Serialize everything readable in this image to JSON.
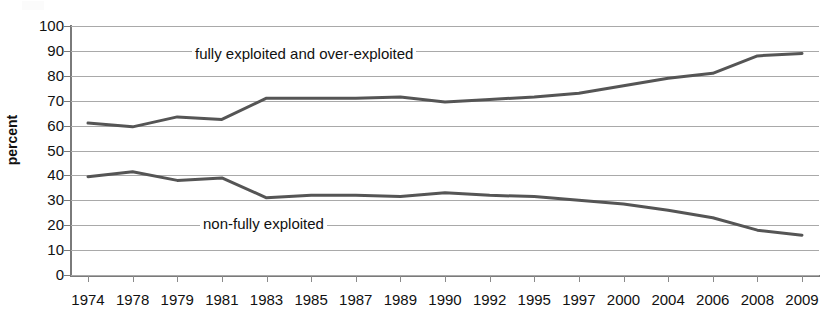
{
  "chart_data": {
    "type": "line",
    "title": "",
    "subtitle": "",
    "xlabel": "",
    "ylabel": "percent",
    "ylim": [
      0,
      100
    ],
    "ytick_step": 10,
    "yticks": [
      100,
      90,
      80,
      70,
      60,
      50,
      40,
      30,
      20,
      10,
      0
    ],
    "grid": true,
    "legend_position": "inline-annotations",
    "categories": [
      "1974",
      "1978",
      "1979",
      "1981",
      "1983",
      "1985",
      "1987",
      "1989",
      "1990",
      "1992",
      "1995",
      "1997",
      "2000",
      "2004",
      "2006",
      "2008",
      "2009"
    ],
    "series": [
      {
        "name": "fully exploited and over-exploited",
        "color": "#555555",
        "values": [
          61,
          59.5,
          63.5,
          62.5,
          71,
          71,
          71,
          71.5,
          69.5,
          70.5,
          71.5,
          73,
          76,
          79,
          81,
          88,
          89
        ]
      },
      {
        "name": "non-fully exploited",
        "color": "#555555",
        "values": [
          39.5,
          41.5,
          38,
          39,
          31,
          32,
          32,
          31.5,
          33,
          32,
          31.5,
          30,
          28.5,
          26,
          23,
          18,
          16
        ]
      }
    ],
    "annotations": [
      {
        "text": "fully exploited and over-exploited",
        "series": "fully exploited and over-exploited"
      },
      {
        "text": "non-fully exploited",
        "series": "non-fully exploited"
      }
    ]
  },
  "axis": {
    "y_title": "percent",
    "y_tick_labels": [
      "100",
      "90",
      "80",
      "70",
      "60",
      "50",
      "40",
      "30",
      "20",
      "10",
      "0"
    ],
    "x_tick_labels": [
      "1974",
      "1978",
      "1979",
      "1981",
      "1983",
      "1985",
      "1987",
      "1989",
      "1990",
      "1992",
      "1995",
      "1997",
      "2000",
      "2004",
      "2006",
      "2008",
      "2009"
    ]
  },
  "colors": {
    "line": "#555555",
    "gridline": "#a9a9a9",
    "axis": "#7a7a7a",
    "background": "#ffffff",
    "text": "#111111"
  }
}
